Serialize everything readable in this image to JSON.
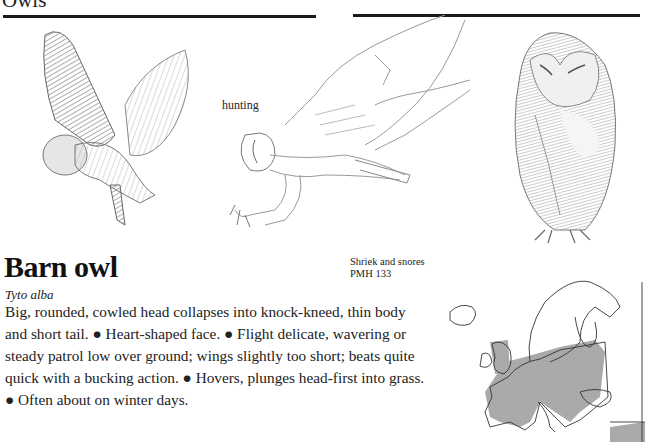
{
  "page": {
    "section_title": "Owls"
  },
  "illustrations": [
    {
      "id": "flying-owl",
      "description": "Barn owl in flight, wings raised, shaded drawing"
    },
    {
      "id": "hunting-owl",
      "description": "Barn owl swooping down with talons extended, line drawing",
      "caption": "hunting"
    },
    {
      "id": "perched-owl",
      "description": "Barn owl perched upright, shaded drawing"
    }
  ],
  "species": {
    "common_name": "Barn owl",
    "latin_name": "Tyto alba",
    "voice_note": "Shriek and snores",
    "reference": "PMH 133",
    "description": "Big, rounded, cowled head collapses into knock-kneed, thin body and short tail. ● Heart-shaped face. ● Flight delicate, wavering or steady patrol low over ground; wings slightly too short; beats quite quick with a bucking action. ● Hovers, plunges head-first into grass. ● Often about on winter days."
  },
  "range_map": {
    "region": "Europe",
    "range_color": "#a8a8a8",
    "outline_color": "#333333"
  }
}
